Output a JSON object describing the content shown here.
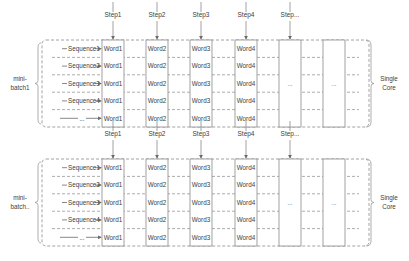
{
  "blocks": [
    {
      "label_line1": "mini-",
      "label_line2": "batch1",
      "core_line1": "Single",
      "core_line2": "Core",
      "steps": [
        "Step1",
        "Step2",
        "Step3",
        "Step4",
        "Step..."
      ],
      "sequences": [
        "Sequence1",
        "Sequence2",
        "Sequence3",
        "Sequence4",
        "..."
      ],
      "columns": [
        {
          "words": [
            "Word1",
            "Word1",
            "Word1",
            "Word1",
            "Word1"
          ]
        },
        {
          "words": [
            "Word2",
            "Word2",
            "Word2",
            "Word2",
            "Word2"
          ]
        },
        {
          "words": [
            "Word3",
            "Word3",
            "Word3",
            "Word3",
            "Word3"
          ]
        },
        {
          "words": [
            "Word4",
            "Word4",
            "Word4",
            "Word4",
            "Word4"
          ]
        },
        {
          "center": "..."
        },
        {
          "center": "..."
        }
      ]
    },
    {
      "label_line1": "mini-",
      "label_line2": "batch..",
      "core_line1": "Single",
      "core_line2": "Core",
      "steps": [
        "Step1",
        "Step2",
        "Step3",
        "Step4",
        "Step..."
      ],
      "sequences": [
        "Sequence1",
        "Sequence2",
        "Sequence3",
        "Sequence4",
        "..."
      ],
      "columns": [
        {
          "words": [
            "Word1",
            "Word1",
            "Word1",
            "Word1",
            "Word1"
          ]
        },
        {
          "words": [
            "Word2",
            "Word2",
            "Word2",
            "Word2",
            "Word2"
          ]
        },
        {
          "words": [
            "Word3",
            "Word3",
            "Word3",
            "Word3",
            "Word3"
          ]
        },
        {
          "words": [
            "Word4",
            "Word4",
            "Word4",
            "Word4",
            "Word4"
          ]
        },
        {
          "center": "..."
        },
        {
          "center": "..."
        }
      ]
    }
  ],
  "colors": {
    "line": "#8a8a8a",
    "text": "#404040",
    "box_fill": "#ffffff"
  }
}
